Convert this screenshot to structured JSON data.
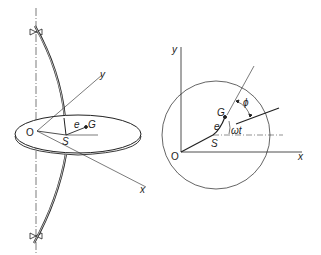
{
  "diagram": {
    "left_view": {
      "labels": {
        "origin": "O",
        "y_axis": "y",
        "x_axis": "x",
        "shaft_center": "S",
        "eccentricity": "e",
        "mass_center": "G"
      }
    },
    "right_view": {
      "labels": {
        "origin": "O",
        "y_axis": "y",
        "x_axis": "x",
        "shaft_center": "S",
        "eccentricity": "e",
        "mass_center": "G",
        "rotation_angle": "ωt",
        "phase_angle": "ϕ"
      }
    },
    "colors": {
      "line": "#222222",
      "background": "#ffffff"
    }
  }
}
